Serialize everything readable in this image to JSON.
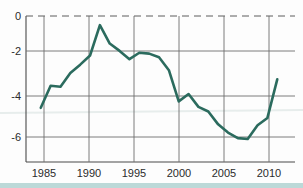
{
  "chart_data": {
    "type": "line",
    "title": "",
    "subtitle": "",
    "xlabel": "",
    "ylabel": "",
    "xlim": [
      1983.5,
      2010.8
    ],
    "ylim": [
      -7.4,
      0.55
    ],
    "xticks": [
      1985,
      1990,
      1995,
      2000,
      2005,
      2010
    ],
    "xtick_labels": [
      "1985",
      "1990",
      "1995",
      "2000",
      "2005",
      "2010"
    ],
    "yticks": [
      0,
      -2,
      -4,
      -6
    ],
    "ytick_labels": [
      "0",
      "-2",
      "-4",
      "-6"
    ],
    "grid": "both",
    "legend": "none",
    "zero_line_style": "dashed",
    "series": [
      {
        "name": "value",
        "color": "#2b6b5e",
        "x": [
          1985,
          1986,
          1987,
          1988,
          1989,
          1990,
          1991,
          1992,
          1993,
          1994,
          1995,
          1996,
          1997,
          1998,
          1999,
          2000,
          2001,
          2002,
          2003,
          2004,
          2005,
          2006,
          2007,
          2008,
          2009
        ],
        "values": [
          -4.45,
          -3.25,
          -3.3,
          -2.55,
          -2.1,
          -1.6,
          0.05,
          -0.95,
          -1.35,
          -1.8,
          -1.45,
          -1.5,
          -1.7,
          -2.4,
          -4.1,
          -3.7,
          -4.4,
          -4.65,
          -5.35,
          -5.8,
          -6.1,
          -6.15,
          -5.4,
          -5.0,
          -2.9
        ]
      }
    ]
  },
  "axis": {
    "y_labels": [
      "0",
      "-2",
      "-4",
      "-6"
    ],
    "x_labels": [
      "1985",
      "1990",
      "1995",
      "2000",
      "2005",
      "2010"
    ]
  },
  "colors": {
    "line": "#2b6b5e",
    "grid": "#6e6e6e",
    "axis": "#4a4a4a",
    "footer_band": "#bcd9d8",
    "background": "#fdfdfd"
  }
}
